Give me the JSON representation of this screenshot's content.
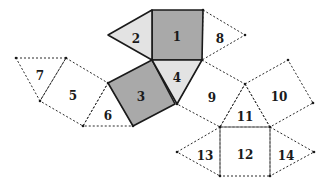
{
  "diagram": {
    "title": "",
    "type": "polyhedron-net",
    "colors": {
      "dark_face": "#a9a9a9",
      "light_face": "#e3e3e3",
      "outline_solid": "#1a1a1a",
      "outline_dashed": "#2a2a2a",
      "background": "#ffffff"
    },
    "faces": [
      {
        "id": "1",
        "shape": "square",
        "style": "dark",
        "points": [
          [
            152,
            10
          ],
          [
            203,
            10
          ],
          [
            202,
            60
          ],
          [
            152,
            60
          ]
        ],
        "label_pos": [
          177,
          37
        ]
      },
      {
        "id": "2",
        "shape": "triangle",
        "style": "light",
        "points": [
          [
            108,
            35
          ],
          [
            152,
            10
          ],
          [
            152,
            60
          ]
        ],
        "label_pos": [
          136,
          39
        ]
      },
      {
        "id": "3",
        "shape": "square",
        "style": "dark",
        "points": [
          [
            152,
            60
          ],
          [
            175,
            104
          ],
          [
            133,
            126
          ],
          [
            108,
            83
          ]
        ],
        "label_pos": [
          141,
          97
        ]
      },
      {
        "id": "4",
        "shape": "triangle",
        "style": "light",
        "points": [
          [
            152,
            60
          ],
          [
            202,
            60
          ],
          [
            177,
            104
          ]
        ],
        "label_pos": [
          177,
          78
        ]
      },
      {
        "id": "5",
        "shape": "square",
        "style": "dashed",
        "points": [
          [
            66,
            58
          ],
          [
            108,
            83
          ],
          [
            83,
            126
          ],
          [
            40,
            101
          ]
        ],
        "label_pos": [
          73,
          96
        ]
      },
      {
        "id": "6",
        "shape": "triangle",
        "style": "dashed",
        "points": [
          [
            108,
            83
          ],
          [
            133,
            126
          ],
          [
            83,
            126
          ]
        ],
        "label_pos": [
          108,
          116
        ]
      },
      {
        "id": "7",
        "shape": "triangle",
        "style": "dashed",
        "points": [
          [
            16,
            58
          ],
          [
            66,
            58
          ],
          [
            40,
            101
          ]
        ],
        "label_pos": [
          40,
          76
        ]
      },
      {
        "id": "8",
        "shape": "triangle",
        "style": "dashed",
        "points": [
          [
            203,
            10
          ],
          [
            245,
            35
          ],
          [
            202,
            60
          ]
        ],
        "label_pos": [
          220,
          39
        ]
      },
      {
        "id": "9",
        "shape": "square",
        "style": "dashed",
        "points": [
          [
            202,
            60
          ],
          [
            245,
            84
          ],
          [
            220,
            127
          ],
          [
            177,
            104
          ]
        ],
        "label_pos": [
          212,
          98
        ]
      },
      {
        "id": "10",
        "shape": "square",
        "style": "dashed",
        "points": [
          [
            245,
            84
          ],
          [
            288,
            60
          ],
          [
            313,
            103
          ],
          [
            270,
            127
          ]
        ],
        "label_pos": [
          279,
          97
        ]
      },
      {
        "id": "11",
        "shape": "triangle",
        "style": "dashed",
        "points": [
          [
            245,
            84
          ],
          [
            270,
            127
          ],
          [
            220,
            127
          ]
        ],
        "label_pos": [
          245,
          117
        ]
      },
      {
        "id": "12",
        "shape": "square",
        "style": "dashed",
        "points": [
          [
            220,
            127
          ],
          [
            270,
            127
          ],
          [
            270,
            176
          ],
          [
            220,
            176
          ]
        ],
        "label_pos": [
          245,
          155
        ]
      },
      {
        "id": "13",
        "shape": "triangle",
        "style": "dashed",
        "points": [
          [
            177,
            152
          ],
          [
            220,
            127
          ],
          [
            220,
            176
          ]
        ],
        "label_pos": [
          205,
          156
        ]
      },
      {
        "id": "14",
        "shape": "triangle",
        "style": "dashed",
        "points": [
          [
            270,
            127
          ],
          [
            314,
            152
          ],
          [
            270,
            176
          ]
        ],
        "label_pos": [
          286,
          156
        ]
      }
    ]
  }
}
